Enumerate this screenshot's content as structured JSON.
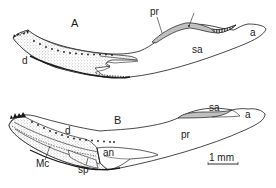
{
  "figure": {
    "panels": [
      {
        "id": "A",
        "label": "A",
        "structures": {
          "d": "d",
          "pr": "pr",
          "sa": "sa",
          "a": "a"
        }
      },
      {
        "id": "B",
        "label": "B",
        "structures": {
          "d": "d",
          "pr": "pr",
          "sa": "sa",
          "a": "a",
          "an": "an",
          "Mc": "Mc",
          "sp": "sp"
        }
      }
    ],
    "scale_bar": {
      "label": "1 mm"
    },
    "colors": {
      "line": "#1a1a1a",
      "stipple": "#8a8a8a",
      "dark_hatch": "#3a3a3a",
      "background": "#ffffff"
    }
  }
}
